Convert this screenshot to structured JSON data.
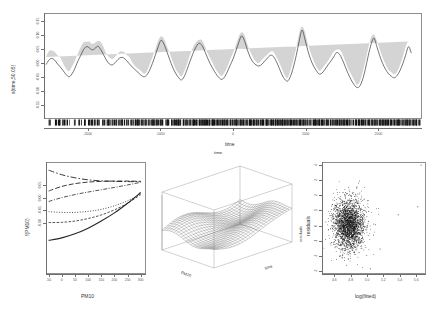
{
  "figure": {
    "background": "#ffffff",
    "line_color": "#3a3a3a",
    "band_color": "#cfcfcf",
    "point_color": "#111111",
    "axis_color": "#8e8e8e"
  },
  "chart_data": [
    {
      "id": "top-time-smooth",
      "type": "line",
      "title": "",
      "xlabel": "time",
      "ylabel": "s(time,50.05)",
      "xlim": [
        -2600,
        2600
      ],
      "ylim": [
        -0.2,
        0.18
      ],
      "xticks": [
        "-2000",
        "-1000",
        "0",
        "1000",
        "2000"
      ],
      "xtick_values": [
        -2000,
        -1000,
        0,
        1000,
        2000
      ],
      "yticks": [
        "0.15",
        "0.10",
        "0.05",
        "0.00",
        "-0.05",
        "-0.10",
        "-0.15"
      ],
      "ytick_values": [
        0.15,
        0.1,
        0.05,
        0.0,
        -0.05,
        -0.1,
        -0.15
      ],
      "grid": false,
      "legend": "none",
      "has_confidence_band": true,
      "has_rug": true,
      "series": [
        {
          "name": "s(time)",
          "x": [
            -2600,
            -2560,
            -2520,
            -2480,
            -2440,
            -2400,
            -2360,
            -2320,
            -2280,
            -2240,
            -2200,
            -2160,
            -2120,
            -2080,
            -2040,
            -2000,
            -1960,
            -1920,
            -1880,
            -1840,
            -1800,
            -1760,
            -1720,
            -1680,
            -1640,
            -1600,
            -1560,
            -1520,
            -1480,
            -1440,
            -1400,
            -1360,
            -1320,
            -1280,
            -1240,
            -1200,
            -1160,
            -1120,
            -1080,
            -1040,
            -1000,
            -960,
            -920,
            -880,
            -840,
            -800,
            -760,
            -720,
            -680,
            -640,
            -600,
            -560,
            -520,
            -480,
            -440,
            -400,
            -360,
            -320,
            -280,
            -240,
            -200,
            -160,
            -120,
            -80,
            -40,
            0,
            40,
            80,
            120,
            160,
            200,
            240,
            280,
            320,
            360,
            400,
            440,
            480,
            520,
            560,
            600,
            640,
            680,
            720,
            760,
            800,
            840,
            880,
            920,
            960,
            1000,
            1040,
            1080,
            1120,
            1160,
            1200,
            1240,
            1280,
            1320,
            1360,
            1400,
            1440,
            1480,
            1520,
            1560,
            1600,
            1640,
            1680,
            1720,
            1760,
            1800,
            1840,
            1880,
            1920,
            1960,
            2000,
            2040,
            2080,
            2120,
            2160,
            2200,
            2240,
            2280,
            2320,
            2360,
            2400,
            2440,
            2480,
            2520,
            2560,
            2600
          ],
          "y": [
            -0.005,
            0.012,
            0.018,
            0.012,
            -0.002,
            -0.014,
            -0.028,
            -0.042,
            -0.05,
            -0.04,
            -0.02,
            0.006,
            0.028,
            0.05,
            0.062,
            0.058,
            0.05,
            0.055,
            0.064,
            0.052,
            0.032,
            0.012,
            -0.002,
            -0.006,
            0.002,
            0.014,
            0.022,
            0.02,
            0.01,
            -0.002,
            -0.014,
            -0.024,
            -0.034,
            -0.044,
            -0.05,
            -0.044,
            -0.026,
            0.0,
            0.03,
            0.062,
            0.086,
            0.072,
            0.044,
            0.014,
            -0.014,
            -0.036,
            -0.052,
            -0.062,
            -0.05,
            -0.024,
            0.006,
            0.034,
            0.058,
            0.074,
            0.07,
            0.05,
            0.024,
            0.0,
            -0.02,
            -0.038,
            -0.052,
            -0.06,
            -0.052,
            -0.032,
            -0.008,
            0.016,
            0.046,
            0.078,
            0.102,
            0.084,
            0.05,
            0.022,
            0.004,
            -0.006,
            -0.01,
            -0.004,
            0.008,
            0.02,
            0.03,
            0.026,
            0.008,
            -0.016,
            -0.042,
            -0.06,
            -0.066,
            -0.048,
            -0.014,
            0.03,
            0.082,
            0.124,
            0.09,
            0.048,
            0.014,
            -0.01,
            -0.028,
            -0.04,
            -0.036,
            -0.022,
            -0.006,
            0.008,
            0.024,
            0.04,
            0.034,
            0.014,
            -0.012,
            -0.038,
            -0.06,
            -0.078,
            -0.09,
            -0.086,
            -0.062,
            -0.022,
            0.028,
            0.07,
            0.094,
            0.062,
            0.028,
            0.0,
            -0.022,
            -0.038,
            -0.048,
            -0.054,
            -0.046,
            -0.028,
            -0.002,
            0.03,
            0.062,
            0.038,
            0.012
          ]
        }
      ]
    },
    {
      "id": "bottom-left-pm10",
      "type": "line",
      "title": "",
      "xlabel": "PM10",
      "ylabel": "f(PM10)",
      "xlim": [
        -60,
        320
      ],
      "ylim": [
        -0.3,
        0.14
      ],
      "xticks": [
        "-50",
        "0",
        "50",
        "100",
        "150",
        "200",
        "250",
        "300"
      ],
      "xtick_values": [
        -50,
        0,
        50,
        100,
        150,
        200,
        250,
        300
      ],
      "yticks": [
        "0.05",
        "0.00",
        "-0.05",
        "-0.10"
      ],
      "ytick_values": [
        0.05,
        0.0,
        -0.05,
        -0.1
      ],
      "grid": false,
      "legend": "none",
      "series": [
        {
          "name": "curve-1-dashdot-rising",
          "dash": "6,2,1.5,2",
          "width": 0.9,
          "x": [
            -50,
            0,
            50,
            100,
            150,
            200,
            250,
            300
          ],
          "y": [
            0.108,
            0.09,
            0.078,
            0.07,
            0.066,
            0.064,
            0.063,
            0.063
          ]
        },
        {
          "name": "curve-2-longdash",
          "dash": "5,2",
          "width": 0.9,
          "x": [
            -50,
            0,
            50,
            100,
            150,
            200,
            250,
            300
          ],
          "y": [
            0.026,
            0.044,
            0.055,
            0.061,
            0.064,
            0.065,
            0.065,
            0.064
          ]
        },
        {
          "name": "curve-3-dashdot",
          "dash": "4,1.5,1,1.5",
          "width": 0.8,
          "x": [
            -50,
            0,
            50,
            100,
            150,
            200,
            250,
            300
          ],
          "y": [
            -0.015,
            0.0,
            0.012,
            0.022,
            0.031,
            0.04,
            0.05,
            0.06
          ]
        },
        {
          "name": "curve-4-dotted",
          "dash": "1,1.6",
          "width": 0.8,
          "x": [
            -50,
            0,
            50,
            100,
            150,
            200,
            250,
            300
          ],
          "y": [
            -0.055,
            -0.058,
            -0.058,
            -0.054,
            -0.046,
            -0.032,
            -0.012,
            0.014
          ]
        },
        {
          "name": "curve-5-dashed",
          "dash": "2.5,1.5",
          "width": 0.8,
          "x": [
            -50,
            0,
            50,
            100,
            150,
            200,
            250,
            300
          ],
          "y": [
            -0.098,
            -0.097,
            -0.092,
            -0.082,
            -0.068,
            -0.048,
            -0.022,
            0.012
          ]
        },
        {
          "name": "curve-6-solid",
          "dash": "",
          "width": 1.1,
          "x": [
            -50,
            0,
            50,
            100,
            150,
            200,
            250,
            300
          ],
          "y": [
            -0.168,
            -0.158,
            -0.142,
            -0.12,
            -0.092,
            -0.06,
            -0.022,
            0.02
          ]
        }
      ]
    },
    {
      "id": "bottom-middle-surface",
      "type": "heatmap",
      "title": "time",
      "xlabel": "PM10",
      "ylabel": "time",
      "zlabel": "residuals",
      "projection": "3d-perspective-wireframe",
      "grid": true,
      "legend": "none"
    },
    {
      "id": "bottom-right-residuals",
      "type": "scatter",
      "title": "",
      "xlabel": "log(fitted)",
      "ylabel": "residuals",
      "xlim": [
        4.45,
        5.72
      ],
      "ylim": [
        -3.2,
        4.2
      ],
      "xticks": [
        "4.6",
        "4.8",
        "5.0",
        "5.2",
        "5.4",
        "5.6"
      ],
      "xtick_values": [
        4.6,
        4.8,
        5.0,
        5.2,
        5.4,
        5.6
      ],
      "yticks": [
        "4",
        "3",
        "2",
        "1",
        "0",
        "-1",
        "-2",
        "-3"
      ],
      "ytick_values": [
        4,
        3,
        2,
        1,
        0,
        -1,
        -2,
        -3
      ],
      "grid": false,
      "legend": "none",
      "n_points": 2400,
      "cluster_center": [
        4.78,
        0.05
      ],
      "cluster_spread": [
        0.095,
        0.85
      ],
      "outliers": [
        [
          5.66,
          4.0
        ],
        [
          5.62,
          1.25
        ],
        [
          5.38,
          0.72
        ],
        [
          5.1,
          0.05
        ],
        [
          5.08,
          -0.62
        ],
        [
          5.16,
          -1.55
        ],
        [
          5.04,
          -2.85
        ],
        [
          5.02,
          0.95
        ]
      ]
    }
  ]
}
